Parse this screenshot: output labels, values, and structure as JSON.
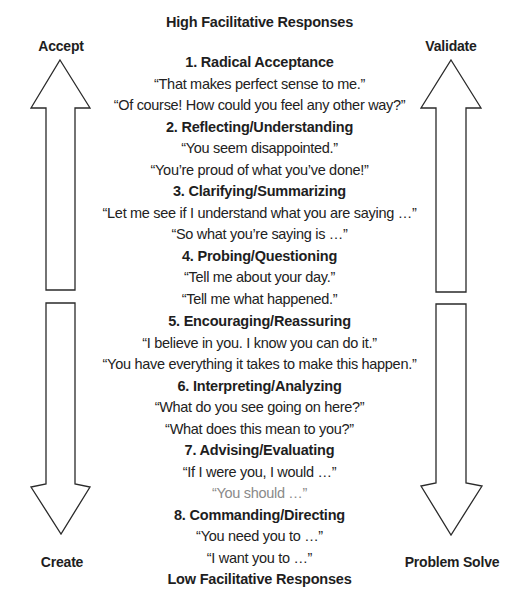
{
  "top_title": "High Facilitative Responses",
  "bottom_title": "Low Facilitative Responses",
  "side_labels": {
    "top_left": "Accept",
    "top_right": "Validate",
    "bottom_left": "Create",
    "bottom_right": "Problem Solve"
  },
  "high_responses": [
    {
      "heading": "1.  Radical Acceptance",
      "quotes": [
        "“That makes perfect sense to me.”",
        "“Of course! How could you feel any other way?”"
      ]
    },
    {
      "heading": "2.  Reflecting/Understanding",
      "quotes": [
        "“You seem disappointed.”",
        "“You’re proud of what you’ve done!”"
      ]
    },
    {
      "heading": "3.  Clarifying/Summarizing",
      "quotes": [
        "“Let me see if I understand what you are saying …”",
        "“So what you’re saying is …”"
      ]
    },
    {
      "heading": "4.  Probing/Questioning",
      "quotes": [
        "“Tell me about your day.”",
        "“Tell me what happened.”"
      ]
    }
  ],
  "low_responses": [
    {
      "heading": "5.  Encouraging/Reassuring",
      "quotes": [
        "“I believe in you. I know you can do it.”",
        "“You have everything it takes to make this happen.”"
      ]
    },
    {
      "heading": "6.  Interpreting/Analyzing",
      "quotes": [
        "“What do you see going on here?”",
        "“What does this mean to you?”"
      ]
    },
    {
      "heading": "7.  Advising/Evaluating",
      "quotes": [
        "“If I were you, I would …”",
        "“You should …”"
      ]
    },
    {
      "heading": "8.  Commanding/Directing",
      "quotes": [
        "“You need you to …”",
        "“I want you to …”"
      ]
    }
  ],
  "arrows": [
    {
      "name": "accept-up-arrow",
      "direction": "up"
    },
    {
      "name": "create-down-arrow",
      "direction": "down"
    },
    {
      "name": "validate-up-arrow",
      "direction": "up"
    },
    {
      "name": "problem-solve-down-arrow",
      "direction": "down"
    }
  ]
}
